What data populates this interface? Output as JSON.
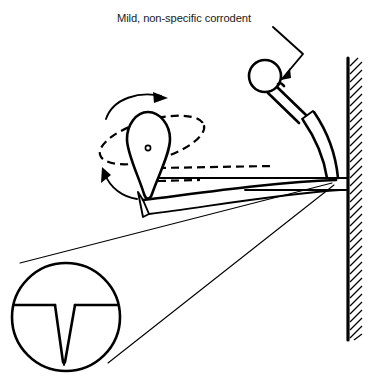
{
  "figure": {
    "title_annotation": "Mild, non-specific corrodent",
    "caption_visible": false,
    "background_color": "#ffffff",
    "line_color": "#000000",
    "width_px": 374,
    "height_px": 387
  },
  "annotations": [
    {
      "id": "corrodent-label",
      "text": "Mild, non-specific corrodent",
      "x": 117,
      "y": 22,
      "points_to": "spray-nozzle-head",
      "leader": "bent-arrow"
    }
  ],
  "parts": {
    "wall": {
      "name": "hatched-wall",
      "orientation": "vertical",
      "x": 347,
      "top_y": 58,
      "bottom_y": 340,
      "hatch_direction": "diagonal",
      "hatch_count": 36
    },
    "nozzle": {
      "name": "spray-nozzle-head",
      "head_shape": "circle",
      "head_center_x": 265,
      "head_center_y": 76,
      "head_radius": 16,
      "neck": "tapered-stem",
      "collar_x": 308,
      "collar_y": 114,
      "arm": "curved-pipe-to-wall"
    },
    "rotor": {
      "name": "teardrop-rotor",
      "shape": "pear",
      "pivot_x": 148,
      "pivot_y": 148,
      "pivot_dot_radius": 2.6,
      "rotation_path": "dashed-ellipse",
      "rotation_arrows": 2
    },
    "surface": {
      "name": "curved-specimen-surface",
      "style": "curved-band",
      "dashed_reference_lines": 2
    },
    "inset": {
      "name": "magnified-detail-circle",
      "center_x": 66,
      "center_y": 317,
      "radius": 54,
      "contents": "surface-line-with-v-pit",
      "pit_shape": "v-notch",
      "pit_depth_px": 56,
      "leader_lines": 2,
      "leader_origin_x": 332,
      "leader_origin_y": 183
    }
  },
  "icons": {
    "rotation_arrow_top": "curved-arrow-right-icon",
    "rotation_arrow_bottom": "curved-arrow-upleft-icon",
    "leader_arrow": "arrowhead-icon"
  }
}
